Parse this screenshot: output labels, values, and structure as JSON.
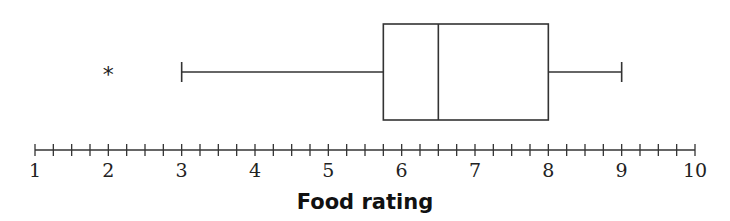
{
  "chart_data": {
    "type": "boxplot",
    "title": "",
    "xlabel": "Food rating",
    "ylabel": "",
    "xlim": [
      1,
      10
    ],
    "major_ticks": [
      1,
      2,
      3,
      4,
      5,
      6,
      7,
      8,
      9,
      10
    ],
    "minor_tick_step": 0.25,
    "grid": false,
    "orientation": "horizontal",
    "series": [
      {
        "name": "Food rating",
        "min": 3,
        "q1": 5.75,
        "median": 6.5,
        "q3": 8,
        "max": 9,
        "outliers": [
          2
        ]
      }
    ],
    "outlier_marker": "*"
  },
  "colors": {
    "stroke": "#333333",
    "background": "#ffffff"
  }
}
